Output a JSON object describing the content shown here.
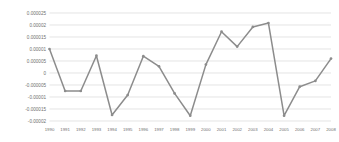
{
  "chart_data": {
    "type": "line",
    "title": "",
    "subtitle": "",
    "xlabel": "",
    "ylabel": "",
    "categories": [
      "1990",
      "1991",
      "1992",
      "1993",
      "1994",
      "1995",
      "1996",
      "1997",
      "1998",
      "1999",
      "2000",
      "2001",
      "2002",
      "2003",
      "2004",
      "2005",
      "2006",
      "2007",
      "2008"
    ],
    "values": [
      1e-05,
      -7.5e-06,
      -7.5e-06,
      7.2e-06,
      -1.75e-05,
      -9.2e-06,
      7e-06,
      2.8e-06,
      -8.5e-06,
      -1.78e-05,
      3.5e-06,
      1.72e-05,
      1.1e-05,
      1.92e-05,
      2.08e-05,
      -1.78e-05,
      -5.7e-06,
      -3.3e-06,
      6e-06
    ],
    "series": [
      {
        "name": "series1",
        "values": [
          1e-05,
          -7.5e-06,
          -7.5e-06,
          7.2e-06,
          -1.75e-05,
          -9.2e-06,
          7e-06,
          2.8e-06,
          -8.5e-06,
          -1.78e-05,
          3.5e-06,
          1.72e-05,
          1.1e-05,
          1.92e-05,
          2.08e-05,
          -1.78e-05,
          -5.7e-06,
          -3.3e-06,
          6e-06
        ],
        "color": "#8c8c8c"
      }
    ],
    "ylim": [
      -2e-05,
      2.5e-05
    ],
    "ytick_values": [
      2.5e-05,
      2e-05,
      1.5e-05,
      1e-05,
      5e-06,
      0,
      -5e-06,
      -1e-05,
      -1.5e-05,
      -2e-05
    ],
    "ytick_labels": [
      "0.000025",
      "0.00002",
      "0.000015",
      "0.00001",
      "0.000005",
      "0",
      "-0.000005",
      "-0.00001",
      "-0.000015",
      "-0.00002"
    ],
    "grid": true,
    "grid_color": "#d9d9d9",
    "legend": false,
    "legend_position": "none",
    "marker": "circle",
    "line_color": "#8c8c8c",
    "marker_color": "#8c8c8c",
    "background_color": "#ffffff",
    "annotations": []
  }
}
